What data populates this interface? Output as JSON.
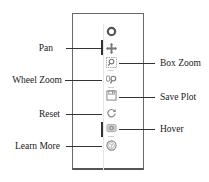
{
  "diagram": {
    "tools": [
      {
        "key": "logo",
        "icon": "bokeh-logo-icon",
        "label": ""
      },
      {
        "key": "pan",
        "icon": "pan-icon",
        "label": "Pan",
        "side": "left",
        "active": true
      },
      {
        "key": "box_zoom",
        "icon": "box-zoom-icon",
        "label": "Box Zoom",
        "side": "right"
      },
      {
        "key": "wheel_zoom",
        "icon": "wheel-zoom-icon",
        "label": "Wheel Zoom",
        "side": "left"
      },
      {
        "key": "save",
        "icon": "save-icon",
        "label": "Save Plot",
        "side": "right"
      },
      {
        "key": "reset",
        "icon": "reset-icon",
        "label": "Reset",
        "side": "left"
      },
      {
        "key": "hover",
        "icon": "hover-icon",
        "label": "Hover",
        "side": "right",
        "active": true
      },
      {
        "key": "help",
        "icon": "help-icon",
        "label": "Learn More",
        "side": "left"
      }
    ],
    "colors": {
      "line": "#333333",
      "icon": "#8a8a8a",
      "frame": "#6a6a6a"
    }
  }
}
